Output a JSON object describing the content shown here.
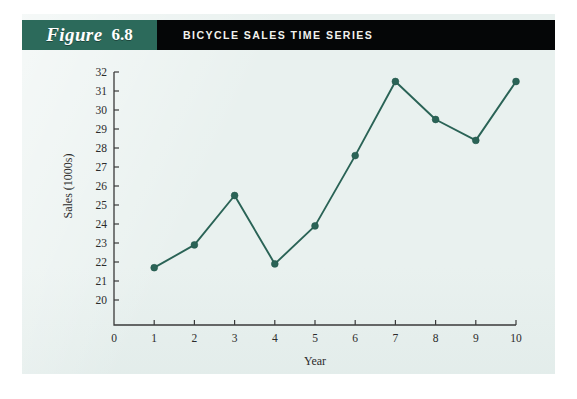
{
  "figure": {
    "label_word": "Figure",
    "number": "6.8",
    "title": "BICYCLE SALES TIME SERIES",
    "accent_color": "#2c6a5b",
    "title_bar_color": "#050607",
    "panel_color": "#e9f1ef"
  },
  "chart_data": {
    "type": "line",
    "title": "BICYCLE SALES TIME SERIES",
    "xlabel": "Year",
    "ylabel": "Sales (1000s)",
    "x": [
      1,
      2,
      3,
      4,
      5,
      6,
      7,
      8,
      9,
      10
    ],
    "values": [
      21.7,
      22.9,
      25.5,
      21.9,
      23.9,
      27.6,
      31.5,
      29.5,
      28.4,
      31.5
    ],
    "series": [
      {
        "name": "Bicycle Sales",
        "color": "#2a6356",
        "values": [
          21.7,
          22.9,
          25.5,
          21.9,
          23.9,
          27.6,
          31.5,
          29.5,
          28.4,
          31.5
        ]
      }
    ],
    "xlim": [
      0,
      10
    ],
    "ylim": [
      20,
      32
    ],
    "y_axis_origin_label": "0",
    "xticks": [
      0,
      1,
      2,
      3,
      4,
      5,
      6,
      7,
      8,
      9,
      10
    ],
    "xtick_labels": [
      "0",
      "1",
      "2",
      "3",
      "4",
      "5",
      "6",
      "7",
      "8",
      "9",
      "10"
    ],
    "yticks": [
      20,
      21,
      22,
      23,
      24,
      25,
      26,
      27,
      28,
      29,
      30,
      31,
      32
    ],
    "ytick_labels": [
      "20",
      "21",
      "22",
      "23",
      "24",
      "25",
      "26",
      "27",
      "28",
      "29",
      "30",
      "31",
      "32"
    ],
    "grid": false,
    "legend": false,
    "marker": "circle",
    "axis_break": true
  }
}
